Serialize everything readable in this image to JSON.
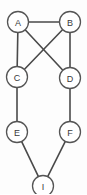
{
  "figure": {
    "name": "undirected-graph",
    "width": 87,
    "height": 194,
    "background_color": "#fdfdfd",
    "node_fill_color": "#ffffff",
    "node_stroke_color": "#555555",
    "edge_color": "#4a4a4a",
    "label_color": "#3a3a3a",
    "node_radius": 10.5
  },
  "chart_data": {
    "type": "diagram",
    "title": "",
    "xlabel": "",
    "ylabel": "",
    "nodes": [
      {
        "id": "A",
        "label": "A",
        "x": 18,
        "y": 22
      },
      {
        "id": "B",
        "label": "B",
        "x": 70,
        "y": 22
      },
      {
        "id": "C",
        "label": "C",
        "x": 17,
        "y": 77
      },
      {
        "id": "D",
        "label": "D",
        "x": 70,
        "y": 78
      },
      {
        "id": "E",
        "label": "E",
        "x": 17,
        "y": 132
      },
      {
        "id": "F",
        "label": "F",
        "x": 70,
        "y": 132
      },
      {
        "id": "I",
        "label": "I",
        "x": 43,
        "y": 186
      }
    ],
    "edges": [
      {
        "from": "A",
        "to": "B"
      },
      {
        "from": "A",
        "to": "C"
      },
      {
        "from": "A",
        "to": "D"
      },
      {
        "from": "B",
        "to": "C"
      },
      {
        "from": "B",
        "to": "D"
      },
      {
        "from": "C",
        "to": "E"
      },
      {
        "from": "D",
        "to": "F"
      },
      {
        "from": "E",
        "to": "I"
      },
      {
        "from": "F",
        "to": "I"
      }
    ]
  }
}
